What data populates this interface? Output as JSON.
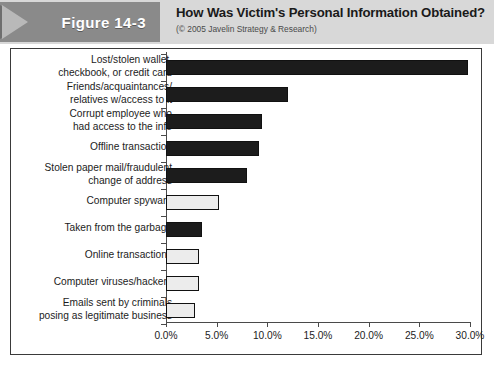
{
  "header": {
    "figure_badge": "Figure 14-3",
    "title": "How Was Victim's Personal Information Obtained?",
    "subtitle": "(© 2005 Javelin Strategy & Research)"
  },
  "chart_data": {
    "type": "bar",
    "orientation": "horizontal",
    "title": "How Was Victim's Personal Information Obtained?",
    "subtitle": "(© 2005 Javelin Strategy & Research)",
    "xlabel": "",
    "ylabel": "",
    "xlim": [
      0,
      30
    ],
    "grid": false,
    "legend": null,
    "tick_labels": [
      "0.0%",
      "5.0%",
      "10.0%",
      "15.0%",
      "20.0%",
      "25.0%",
      "30.0%"
    ],
    "tick_values": [
      0,
      5,
      10,
      15,
      20,
      25,
      30
    ],
    "categories": [
      "Lost/stolen wallet,\ncheckbook, or credit card",
      "Friends/acquaintances/\nrelatives w/access to it",
      "Corrupt employee who\nhad access to the info",
      "Offline transaction",
      "Stolen paper mail/fraudulent\nchange of address",
      "Computer spyware",
      "Taken from the garbage",
      "Online transactions",
      "Computer viruses/hackers",
      "Emails sent by criminals\nposing as legitimate business"
    ],
    "values": [
      29.8,
      12.0,
      9.5,
      9.2,
      8.0,
      5.2,
      3.6,
      3.3,
      3.3,
      2.9
    ],
    "bar_styles": [
      "dark",
      "dark",
      "dark",
      "dark",
      "dark",
      "light",
      "dark",
      "light",
      "light",
      "light"
    ],
    "colors": {
      "dark": "#1c1c1c",
      "light": "#ececec",
      "bar_border": "#111111",
      "axis": "#4a4a4a",
      "header_band": "#d8d8d8",
      "badge": "#8a8a8a",
      "frame_border": "#3a3a3a",
      "text": "#1c1c1c"
    }
  }
}
